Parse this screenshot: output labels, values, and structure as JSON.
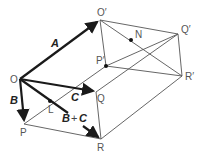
{
  "figure": {
    "colors": {
      "edge": "#555555",
      "vector": "#1a1a1a",
      "label": "#555555",
      "background": "#ffffff"
    },
    "points": {
      "O": {
        "label": "O",
        "x": 20,
        "y": 79
      },
      "O_prime": {
        "label": "O′",
        "x": 100,
        "y": 20
      },
      "P": {
        "label": "P",
        "x": 24,
        "y": 124
      },
      "Q": {
        "label": "Q",
        "x": 96,
        "y": 92
      },
      "R": {
        "label": "R",
        "x": 101,
        "y": 139
      },
      "P_prime": {
        "label": "P′",
        "x": 106,
        "y": 66
      },
      "Q_prime": {
        "label": "Q′",
        "x": 178,
        "y": 34
      },
      "R_prime": {
        "label": "R′",
        "x": 182,
        "y": 76
      },
      "N": {
        "label": "N",
        "x": 131,
        "y": 40
      },
      "L": {
        "label": "L",
        "x": 50,
        "y": 101
      }
    },
    "vectors": {
      "A": {
        "label": "A"
      },
      "B": {
        "label": "B"
      },
      "C": {
        "label": "C"
      },
      "BplusC": {
        "label_b": "B",
        "label_plus": "+",
        "label_c": "C"
      }
    }
  }
}
